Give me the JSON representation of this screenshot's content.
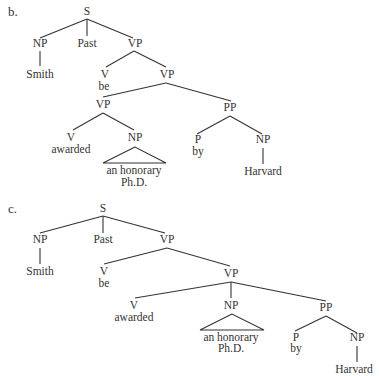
{
  "trees": [
    {
      "label": "b.",
      "nodes": {
        "S": "S",
        "NP1": "NP",
        "Past": "Past",
        "VP1": "VP",
        "Smith": "Smith",
        "V1": "V",
        "be": "be",
        "VP2": "VP",
        "VP3": "VP",
        "PP": "PP",
        "V2": "V",
        "awarded": "awarded",
        "NP2": "NP",
        "P": "P",
        "by": "by",
        "NP3": "NP",
        "honorary1": "an honorary",
        "honorary2": "Ph.D.",
        "Harvard": "Harvard"
      }
    },
    {
      "label": "c.",
      "nodes": {
        "S": "S",
        "NP1": "NP",
        "Past": "Past",
        "VP1": "VP",
        "Smith": "Smith",
        "V1": "V",
        "be": "be",
        "VP2": "VP",
        "V2": "V",
        "awarded": "awarded",
        "NP2": "NP",
        "PP": "PP",
        "honorary1": "an honorary",
        "honorary2": "Ph.D.",
        "P": "P",
        "by": "by",
        "NP3": "NP",
        "Harvard": "Harvard"
      }
    }
  ]
}
